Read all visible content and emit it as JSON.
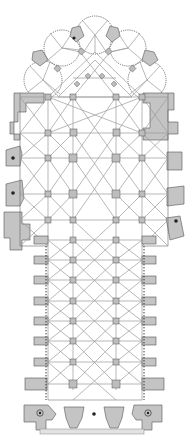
{
  "figure": {
    "type": "architectural floor plan",
    "orientation": "apse at top, west front at bottom",
    "colors": {
      "background": "#ffffff",
      "masonry": "#c4c4c4",
      "outline": "#555555",
      "vault_ribs": "#9a9a9a"
    },
    "features": {
      "radiating_chapels": 5,
      "transept": true,
      "nave_bays": 7,
      "west_towers": 2,
      "stair_turrets": 4
    }
  }
}
